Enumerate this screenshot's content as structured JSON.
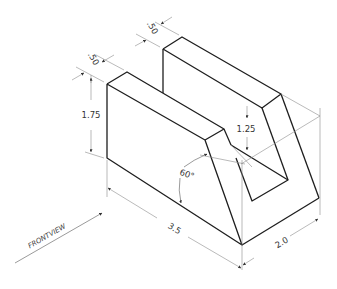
{
  "drawing": {
    "type": "isometric-technical-drawing",
    "dimensions": {
      "front_depth": ".50",
      "back_depth": ".50",
      "front_height": "1.75",
      "back_notch_height": "1.25",
      "angle": "60°",
      "length": "3.5",
      "width": "2.0"
    },
    "view_label": "FRONTVIEW",
    "colors": {
      "edge": "#1e1e1e",
      "dimension": "#8c8c8c",
      "text": "#333333"
    }
  }
}
